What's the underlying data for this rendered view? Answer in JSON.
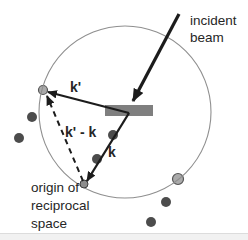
{
  "diagram": {
    "labels": {
      "incident_beam_line1": "incident",
      "incident_beam_line2": "beam",
      "k_prime": "k'",
      "scattering_vector": "k' - k",
      "k": "k",
      "origin_line1": "origin of",
      "origin_line2": "reciprocal",
      "origin_line3": "space"
    },
    "colors": {
      "background": "#ffffff",
      "footer_strip": "#f1f1f1",
      "footer_strip_edge": "#dcdcdc",
      "vector_line": "#1c1c1c",
      "ewald_circle_stroke": "#8f8f8f",
      "sample_fill": "#7f7f7f",
      "lattice_dot": "#4c4c4c",
      "spot_fill": "#aaaaaa",
      "spot_stroke": "#555555",
      "origin_dot_fill": "#8d8d8d",
      "origin_dot_stroke": "#3d3d3d",
      "text": "#262626"
    },
    "geometry": {
      "ewald_circle": {
        "cx": 125,
        "cy": 112,
        "r": 86
      },
      "sphere_center": [
        129,
        113
      ],
      "origin_point": [
        84,
        184
      ],
      "diffraction_spot": [
        43,
        90
      ],
      "right_circle_spot": [
        178,
        179
      ],
      "lattice_points": [
        [
          32,
          117,
          5
        ],
        [
          19,
          138,
          5
        ],
        [
          113,
          135,
          5
        ],
        [
          97,
          159,
          5
        ],
        [
          166,
          202,
          5
        ],
        [
          151,
          222,
          5
        ]
      ]
    }
  }
}
